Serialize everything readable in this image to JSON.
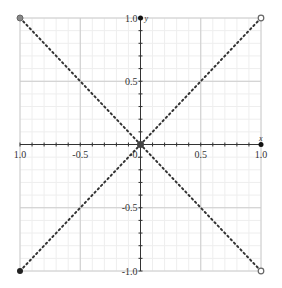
{
  "chart_data": {
    "type": "line",
    "title": "",
    "xlabel": "x",
    "ylabel": "y",
    "xlim": [
      -1.0,
      1.0
    ],
    "ylim": [
      -1.0,
      1.0
    ],
    "grid": true,
    "x_ticks": [
      "-1.0",
      "-0.5",
      "0",
      "0.5",
      "1.0"
    ],
    "y_ticks": [
      "1.0",
      "0.5",
      "-0.5",
      "-1.0"
    ],
    "x_tick_labels": [
      {
        "v": -1.0,
        "label": "1.0"
      },
      {
        "v": -0.5,
        "label": "-0.5"
      },
      {
        "v": 0,
        "label": "-0."
      },
      {
        "v": 0.5,
        "label": "0.5"
      },
      {
        "v": 1.0,
        "label": "1.0"
      }
    ],
    "y_tick_labels": [
      {
        "v": 1.0,
        "label": "1.0"
      },
      {
        "v": 0.5,
        "label": "0.5"
      },
      {
        "v": -0.5,
        "label": "-0.5"
      },
      {
        "v": -1.0,
        "label": "-1.0"
      }
    ],
    "series": [
      {
        "name": "diagonal-down",
        "style": "dotted",
        "points": [
          [
            -1,
            1
          ],
          [
            1,
            -1
          ]
        ]
      },
      {
        "name": "diagonal-up",
        "style": "dotted",
        "points": [
          [
            -1,
            -1
          ],
          [
            1,
            1
          ]
        ]
      }
    ],
    "markers": [
      {
        "x": -1,
        "y": 1,
        "style": "filled-gray"
      },
      {
        "x": 1,
        "y": 1,
        "style": "open"
      },
      {
        "x": -1,
        "y": -1,
        "style": "filled-black"
      },
      {
        "x": 1,
        "y": -1,
        "style": "open"
      },
      {
        "x": 0,
        "y": 0,
        "style": "filled-dark"
      },
      {
        "x": 0,
        "y": 1,
        "style": "axis-arrow"
      },
      {
        "x": 1,
        "y": 0,
        "style": "axis-arrow"
      }
    ],
    "colors": {
      "line": "#333333",
      "grid_major": "#cccccc",
      "grid_minor": "#eeeeee",
      "axis": "#333333"
    }
  }
}
